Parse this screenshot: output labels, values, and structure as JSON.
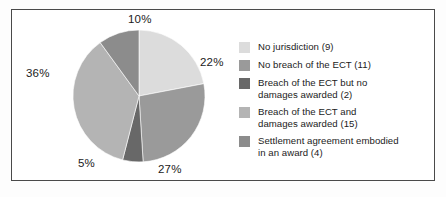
{
  "figure": {
    "border_color": "#4a4a4a",
    "background": "#ffffff"
  },
  "chart_data": {
    "type": "pie",
    "title": "",
    "subtitle": "",
    "xlabel": "",
    "ylabel": "",
    "legend_position": "right",
    "grid": false,
    "total_cases": 41,
    "categories": [
      "No jurisdiction (9)",
      "No breach of the ECT (11)",
      "Breach of the ECT but no damages awarded (2)",
      "Breach of the ECT and damages awarded (15)",
      "Settlement agreement embodied in an award (4)"
    ],
    "values": [
      22,
      27,
      5,
      36,
      10
    ],
    "counts": [
      9,
      11,
      2,
      15,
      4
    ],
    "value_labels": [
      "22%",
      "27%",
      "5%",
      "36%",
      "10%"
    ],
    "colors": [
      "#dcdcdc",
      "#9a9a9a",
      "#686868",
      "#b4b4b4",
      "#8c8c8c"
    ],
    "slices": [
      {
        "label": "No jurisdiction (9)",
        "percent": "22%",
        "value": 22,
        "count": 9,
        "color": "#dcdcdc",
        "start_angle_deg": 0,
        "end_angle_deg": 79.2,
        "label_x": 200,
        "label_y": 56
      },
      {
        "label": "No breach of the ECT (11)",
        "percent": "27%",
        "value": 27,
        "count": 11,
        "color": "#9a9a9a",
        "start_angle_deg": 79.2,
        "end_angle_deg": 176.4,
        "label_x": 158,
        "label_y": 163
      },
      {
        "label": "Breach of the ECT but no damages awarded (2)",
        "percent": "5%",
        "value": 5,
        "count": 2,
        "color": "#686868",
        "start_angle_deg": 176.4,
        "end_angle_deg": 194.4,
        "label_x": 78,
        "label_y": 157
      },
      {
        "label": "Breach of the ECT and damages awarded (15)",
        "percent": "36%",
        "value": 36,
        "count": 15,
        "color": "#b4b4b4",
        "start_angle_deg": 194.4,
        "end_angle_deg": 324.0,
        "label_x": 26,
        "label_y": 67
      },
      {
        "label": "Settlement agreement embodied in an award (4)",
        "percent": "10%",
        "value": 10,
        "count": 4,
        "color": "#8c8c8c",
        "start_angle_deg": 324.0,
        "end_angle_deg": 360.0,
        "label_x": 128,
        "label_y": 13
      }
    ],
    "geometry": {
      "center_x": 139,
      "center_y": 96,
      "radius": 66
    }
  },
  "legend": {
    "items": [
      {
        "label": "No jurisdiction (9)",
        "color": "#dcdcdc"
      },
      {
        "label": "No breach of the ECT (11)",
        "color": "#9a9a9a"
      },
      {
        "label": "Breach of the ECT but no\ndamages awarded (2)",
        "color": "#686868"
      },
      {
        "label": "Breach of the ECT and\ndamages awarded (15)",
        "color": "#b4b4b4"
      },
      {
        "label": "Settlement agreement embodied\nin an award (4)",
        "color": "#8c8c8c"
      }
    ]
  }
}
